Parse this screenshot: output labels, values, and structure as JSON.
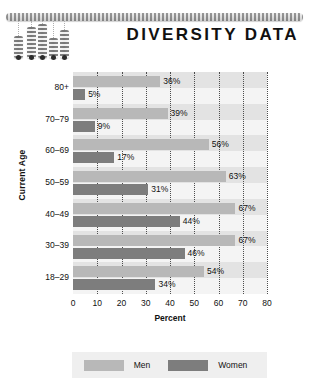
{
  "header": {
    "title": "DIVERSITY DATA",
    "decoration": {
      "rail_name": "dotted-rail",
      "bar_count": 5
    }
  },
  "chart_data": {
    "type": "bar",
    "orientation": "horizontal",
    "title": "DIVERSITY DATA",
    "xlabel": "Percent",
    "ylabel": "Current Age",
    "categories": [
      "80+",
      "70–79",
      "60–69",
      "50–59",
      "40–49",
      "30–39",
      "18–29"
    ],
    "series": [
      {
        "name": "Men",
        "color": "#b8b8b8",
        "values": [
          36,
          39,
          56,
          63,
          67,
          67,
          54
        ]
      },
      {
        "name": "Women",
        "color": "#7d7d7d",
        "values": [
          5,
          9,
          17,
          31,
          44,
          46,
          34
        ]
      }
    ],
    "value_labels": {
      "Men": [
        "36%",
        "39%",
        "56%",
        "63%",
        "67%",
        "67%",
        "54%"
      ],
      "Women": [
        "5%",
        "9%",
        "17%",
        "31%",
        "44%",
        "46%",
        "34%"
      ]
    },
    "xlim": [
      0,
      80
    ],
    "xticks": [
      0,
      10,
      20,
      30,
      40,
      50,
      60,
      70,
      80
    ],
    "xtick_labels": [
      "0",
      "10",
      "20",
      "30",
      "40",
      "50",
      "60",
      "70",
      "80"
    ],
    "grid": "vertical-dotted",
    "legend_position": "bottom"
  },
  "legend": {
    "entries": [
      {
        "label": "Men",
        "color": "#b8b8b8"
      },
      {
        "label": "Women",
        "color": "#7d7d7d"
      }
    ]
  }
}
